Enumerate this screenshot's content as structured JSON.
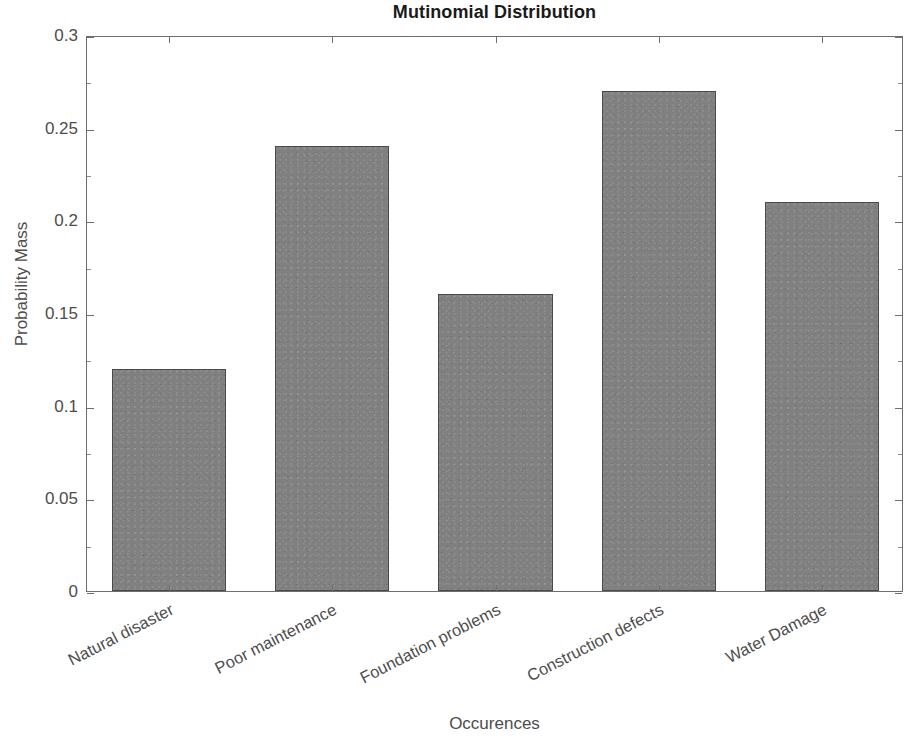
{
  "chart_data": {
    "type": "bar",
    "title": "Mutinomial Distribution",
    "xlabel": "Occurences",
    "ylabel": "Probability Mass",
    "categories": [
      "Natural disaster",
      "Poor maintenance",
      "Foundation problems",
      "Construction defects",
      "Water Damage"
    ],
    "values": [
      0.12,
      0.24,
      0.16,
      0.27,
      0.21
    ],
    "ylim": [
      0,
      0.3
    ],
    "yticks": [
      0,
      0.05,
      0.1,
      0.15,
      0.2,
      0.25,
      0.3
    ],
    "ytick_labels": [
      "0",
      "0.05",
      "0.1",
      "0.15",
      "0.2",
      "0.25",
      "0.3"
    ],
    "grid": false,
    "legend": null,
    "bar_color": "#808080",
    "bar_edge_color": "#4a4a4a",
    "axis_color": "#6e6e6e",
    "text_color": "#4d4d4d",
    "title_color": "#1a1a1a",
    "background": "#ffffff",
    "bar_width_fraction": 0.7,
    "xtick_label_rotation": -27
  }
}
